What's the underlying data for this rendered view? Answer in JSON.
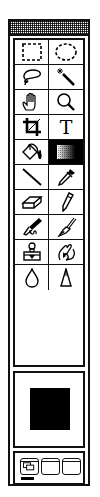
{
  "palette": {
    "title": "",
    "tools": [
      {
        "name": "rectangular-marquee",
        "icon": "rect-marquee-icon"
      },
      {
        "name": "elliptical-marquee",
        "icon": "ellipse-marquee-icon"
      },
      {
        "name": "lasso",
        "icon": "lasso-icon"
      },
      {
        "name": "magic-wand",
        "icon": "magic-wand-icon"
      },
      {
        "name": "hand",
        "icon": "hand-icon"
      },
      {
        "name": "zoom",
        "icon": "magnifier-icon"
      },
      {
        "name": "crop",
        "icon": "crop-icon"
      },
      {
        "name": "type",
        "icon": "type-icon",
        "glyph": "T"
      },
      {
        "name": "paint-bucket",
        "icon": "paint-bucket-icon"
      },
      {
        "name": "gradient",
        "icon": "gradient-icon",
        "active": true
      },
      {
        "name": "line",
        "icon": "line-icon"
      },
      {
        "name": "eyedropper",
        "icon": "eyedropper-icon"
      },
      {
        "name": "eraser",
        "icon": "eraser-icon"
      },
      {
        "name": "pencil",
        "icon": "pencil-icon"
      },
      {
        "name": "airbrush",
        "icon": "airbrush-icon"
      },
      {
        "name": "paintbrush",
        "icon": "paintbrush-icon"
      },
      {
        "name": "rubber-stamp",
        "icon": "stamp-icon"
      },
      {
        "name": "smudge",
        "icon": "smudge-icon"
      },
      {
        "name": "blur",
        "icon": "water-drop-icon"
      },
      {
        "name": "sharpen",
        "icon": "sharpen-cone-icon"
      }
    ],
    "colors": {
      "foreground": "#000000",
      "active_cell_bg": "#000000"
    },
    "screen_modes": [
      {
        "name": "standard-window",
        "selected": true
      },
      {
        "name": "full-screen-menubar",
        "selected": false
      },
      {
        "name": "full-screen",
        "selected": false
      }
    ]
  }
}
